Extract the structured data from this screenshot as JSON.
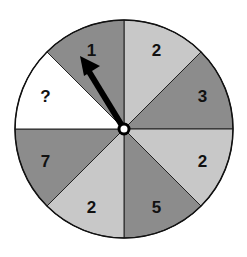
{
  "spinner": {
    "sections": [
      {
        "label": "2",
        "shade": "light",
        "color": "#c8c8c8"
      },
      {
        "label": "3",
        "shade": "dark",
        "color": "#8c8c8c"
      },
      {
        "label": "2",
        "shade": "light",
        "color": "#c8c8c8"
      },
      {
        "label": "5",
        "shade": "dark",
        "color": "#8c8c8c"
      },
      {
        "label": "2",
        "shade": "light",
        "color": "#c8c8c8"
      },
      {
        "label": "7",
        "shade": "dark",
        "color": "#8c8c8c"
      },
      {
        "label": "?",
        "shade": "white",
        "color": "#ffffff"
      },
      {
        "label": "1",
        "shade": "dark",
        "color": "#8c8c8c"
      }
    ],
    "pointer_target": "1"
  }
}
